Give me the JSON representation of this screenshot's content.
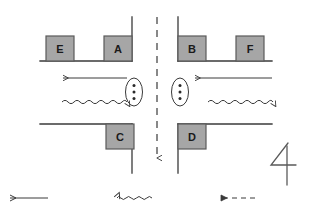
{
  "diagram": {
    "figure_number": "4",
    "background_color": "#ffffff",
    "line_color": "#3a3a3a",
    "vehicle_fill": "#a6a6a6",
    "vehicle_stroke": "#5a5a5a",
    "label_color": "#1a1a1a",
    "centerline": {
      "name": "road-centerline",
      "style": "dashed",
      "orientation": "vertical",
      "arrow_end": "bottom",
      "x": 157,
      "y_start": 17,
      "y_end": 160
    },
    "vehicles": [
      {
        "id": "E",
        "label": "E",
        "x": 46,
        "y": 36,
        "w": 28,
        "h": 25
      },
      {
        "id": "A",
        "label": "A",
        "x": 104,
        "y": 36,
        "w": 28,
        "h": 25
      },
      {
        "id": "B",
        "label": "B",
        "x": 178,
        "y": 36,
        "w": 28,
        "h": 25
      },
      {
        "id": "F",
        "label": "F",
        "x": 236,
        "y": 36,
        "w": 28,
        "h": 25
      },
      {
        "id": "C",
        "label": "C",
        "x": 106,
        "y": 124,
        "w": 28,
        "h": 25
      },
      {
        "id": "D",
        "label": "D",
        "x": 178,
        "y": 124,
        "w": 28,
        "h": 25
      }
    ],
    "roads": [
      {
        "name": "upper-left-kerb-horizontal",
        "x1": 40,
        "y1": 61,
        "x2": 132,
        "y2": 61
      },
      {
        "name": "upper-left-kerb-vertical",
        "x1": 132,
        "y1": 17,
        "x2": 132,
        "y2": 61
      },
      {
        "name": "upper-right-kerb-vertical",
        "x1": 178,
        "y1": 17,
        "x2": 178,
        "y2": 61
      },
      {
        "name": "upper-right-kerb-horizontal",
        "x1": 178,
        "y1": 61,
        "x2": 272,
        "y2": 61
      },
      {
        "name": "lower-left-kerb-horizontal",
        "x1": 40,
        "y1": 124,
        "x2": 132,
        "y2": 124
      },
      {
        "name": "lower-left-kerb-vertical",
        "x1": 132,
        "y1": 124,
        "x2": 132,
        "y2": 173
      },
      {
        "name": "lower-right-kerb-vertical",
        "x1": 178,
        "y1": 124,
        "x2": 178,
        "y2": 173
      },
      {
        "name": "lower-right-kerb-horizontal",
        "x1": 178,
        "y1": 124,
        "x2": 272,
        "y2": 124
      }
    ],
    "flow_arrows": [
      {
        "name": "left-solid-arrow",
        "style": "solid",
        "direction": "left",
        "x1": 127,
        "y1": 78,
        "x2": 62,
        "y2": 78
      },
      {
        "name": "left-wavy-arrow",
        "style": "wavy",
        "direction": "right",
        "x1": 62,
        "y1": 102,
        "x2": 127,
        "y2": 102
      },
      {
        "name": "right-solid-arrow",
        "style": "solid",
        "direction": "left",
        "x1": 272,
        "y1": 78,
        "x2": 194,
        "y2": 78
      },
      {
        "name": "right-wavy-arrow",
        "style": "wavy",
        "direction": "right",
        "x1": 208,
        "y1": 102,
        "x2": 272,
        "y2": 102
      }
    ],
    "pedestrian_markers": [
      {
        "name": "pedestrian-ellipse-left",
        "cx": 134,
        "cy": 92,
        "rx": 9,
        "ry": 14,
        "dots": 3
      },
      {
        "name": "pedestrian-ellipse-right",
        "cx": 180,
        "cy": 92,
        "rx": 9,
        "ry": 14,
        "dots": 3
      }
    ]
  },
  "legend": {
    "name": "legend",
    "items": [
      {
        "id": "legend-solid",
        "style": "solid",
        "direction": "left",
        "x1": 48,
        "y1": 198,
        "x2": 8,
        "y2": 198
      },
      {
        "id": "legend-wavy",
        "style": "wavy",
        "direction": "left",
        "x1": 152,
        "y1": 198,
        "x2": 114,
        "y2": 198
      },
      {
        "id": "legend-dashed",
        "style": "dashed",
        "direction": "left",
        "x1": 255,
        "y1": 198,
        "x2": 218,
        "y2": 198
      }
    ]
  }
}
